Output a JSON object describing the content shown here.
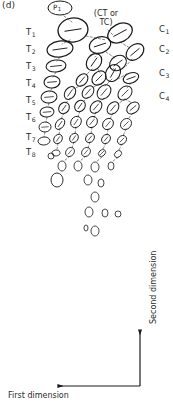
{
  "figure": {
    "panel_id": "(d)",
    "progenitor_label": "P",
    "progenitor_sub": "1",
    "annotation_line1": "(CT or",
    "annotation_line2": "TC)",
    "ink_color": "#1a1a1a",
    "dash_color": "#6b6b6b",
    "background": "#ffffff"
  },
  "time_axis": {
    "name": "T",
    "items": [
      {
        "label": "T",
        "sub": "1",
        "x": 26,
        "y": 33
      },
      {
        "label": "T",
        "sub": "2",
        "x": 26,
        "y": 50
      },
      {
        "label": "T",
        "sub": "3",
        "x": 26,
        "y": 67
      },
      {
        "label": "T",
        "sub": "4",
        "x": 26,
        "y": 84
      },
      {
        "label": "T",
        "sub": "5",
        "x": 26,
        "y": 101
      },
      {
        "label": "T",
        "sub": "6",
        "x": 26,
        "y": 118
      },
      {
        "label": "T",
        "sub": "7",
        "x": 26,
        "y": 138
      },
      {
        "label": "T",
        "sub": "8",
        "x": 26,
        "y": 153
      }
    ]
  },
  "clone_axis": {
    "name": "C",
    "items": [
      {
        "label": "C",
        "sub": "1",
        "x": 159,
        "y": 30
      },
      {
        "label": "C",
        "sub": "2",
        "x": 159,
        "y": 50
      },
      {
        "label": "C",
        "sub": "3",
        "x": 159,
        "y": 74
      },
      {
        "label": "C",
        "sub": "4",
        "x": 159,
        "y": 97
      }
    ]
  },
  "axes": {
    "x_label": "First dimension",
    "y_label": "Second dimension",
    "corner_x": 140,
    "corner_y": 386,
    "x_arrow_end": 58,
    "y_arrow_end": 330
  },
  "chart_data": {
    "type": "scatter",
    "title": "(d)",
    "xlabel": "First dimension",
    "ylabel": "Second dimension",
    "note": "Hand-drawn clonal lineage / cell-division tree; ellipses are cells, dashed segments are lineage links.",
    "cells": [
      {
        "cx": 60,
        "cy": 8,
        "rx": 12,
        "ry": 7,
        "rot": 0,
        "tick": false,
        "w": 1.0,
        "tag": "P1"
      },
      {
        "cx": 73,
        "cy": 30,
        "rx": 15,
        "ry": 12,
        "rot": -8,
        "tick": true,
        "w": 1.3
      },
      {
        "cx": 120,
        "cy": 33,
        "rx": 13,
        "ry": 9,
        "rot": -28,
        "tick": true,
        "w": 1.3
      },
      {
        "cx": 60,
        "cy": 49,
        "rx": 13,
        "ry": 8,
        "rot": -8,
        "tick": true,
        "w": 1.2
      },
      {
        "cx": 100,
        "cy": 45,
        "rx": 11,
        "ry": 8,
        "rot": -18,
        "tick": true,
        "w": 1.2
      },
      {
        "cx": 135,
        "cy": 52,
        "rx": 10,
        "ry": 7,
        "rot": -40,
        "tick": true,
        "w": 1.2
      },
      {
        "cx": 56,
        "cy": 66,
        "rx": 10,
        "ry": 6,
        "rot": -6,
        "tick": true,
        "w": 1.1
      },
      {
        "cx": 94,
        "cy": 62,
        "rx": 9,
        "ry": 7,
        "rot": -55,
        "tick": true,
        "w": 1.2
      },
      {
        "cx": 118,
        "cy": 63,
        "rx": 9,
        "ry": 7,
        "rot": -35,
        "tick": true,
        "w": 1.1
      },
      {
        "cx": 113,
        "cy": 73,
        "rx": 9,
        "ry": 7,
        "rot": -60,
        "tick": true,
        "w": 1.1
      },
      {
        "cx": 52,
        "cy": 82,
        "rx": 8,
        "ry": 6,
        "rot": -5,
        "tick": true,
        "w": 1.1
      },
      {
        "cx": 82,
        "cy": 80,
        "rx": 7,
        "ry": 5,
        "rot": -50,
        "tick": true,
        "w": 1.1
      },
      {
        "cx": 99,
        "cy": 78,
        "rx": 8,
        "ry": 6,
        "rot": -45,
        "tick": true,
        "w": 1.1
      },
      {
        "cx": 131,
        "cy": 78,
        "rx": 8,
        "ry": 5,
        "rot": -20,
        "tick": true,
        "w": 1.1
      },
      {
        "cx": 49,
        "cy": 97,
        "rx": 8,
        "ry": 6,
        "rot": -5,
        "tick": true,
        "w": 1.0
      },
      {
        "cx": 70,
        "cy": 93,
        "rx": 7,
        "ry": 5,
        "rot": -55,
        "tick": true,
        "w": 1.0
      },
      {
        "cx": 88,
        "cy": 92,
        "rx": 7,
        "ry": 5,
        "rot": -50,
        "tick": true,
        "w": 1.0
      },
      {
        "cx": 104,
        "cy": 92,
        "rx": 8,
        "ry": 6,
        "rot": -50,
        "tick": true,
        "w": 1.0
      },
      {
        "cx": 125,
        "cy": 93,
        "rx": 8,
        "ry": 6,
        "rot": -45,
        "tick": true,
        "w": 1.0
      },
      {
        "cx": 47,
        "cy": 112,
        "rx": 7,
        "ry": 5,
        "rot": -5,
        "tick": true,
        "w": 1.0
      },
      {
        "cx": 64,
        "cy": 108,
        "rx": 6,
        "ry": 5,
        "rot": -55,
        "tick": true,
        "w": 1.0
      },
      {
        "cx": 80,
        "cy": 106,
        "rx": 6,
        "ry": 5,
        "rot": -55,
        "tick": true,
        "w": 1.0
      },
      {
        "cx": 96,
        "cy": 107,
        "rx": 7,
        "ry": 5,
        "rot": -50,
        "tick": true,
        "w": 1.0
      },
      {
        "cx": 113,
        "cy": 108,
        "rx": 7,
        "ry": 5,
        "rot": -50,
        "tick": true,
        "w": 1.0
      },
      {
        "cx": 133,
        "cy": 108,
        "rx": 7,
        "ry": 5,
        "rot": -40,
        "tick": true,
        "w": 1.0
      },
      {
        "cx": 45,
        "cy": 127,
        "rx": 6,
        "ry": 5,
        "rot": -5,
        "tick": true,
        "w": 0.9
      },
      {
        "cx": 60,
        "cy": 124,
        "rx": 6,
        "ry": 4,
        "rot": -55,
        "tick": true,
        "w": 0.9
      },
      {
        "cx": 76,
        "cy": 122,
        "rx": 6,
        "ry": 5,
        "rot": -55,
        "tick": true,
        "w": 0.9
      },
      {
        "cx": 92,
        "cy": 122,
        "rx": 6,
        "ry": 5,
        "rot": -50,
        "tick": true,
        "w": 0.9
      },
      {
        "cx": 108,
        "cy": 124,
        "rx": 6,
        "ry": 5,
        "rot": -50,
        "tick": true,
        "w": 0.9
      },
      {
        "cx": 126,
        "cy": 124,
        "rx": 6,
        "ry": 5,
        "rot": -45,
        "tick": true,
        "w": 0.9
      },
      {
        "cx": 44,
        "cy": 141,
        "rx": 6,
        "ry": 4,
        "rot": -5,
        "tick": false,
        "w": 0.9
      },
      {
        "cx": 58,
        "cy": 139,
        "rx": 5,
        "ry": 4,
        "rot": -55,
        "tick": true,
        "w": 0.9
      },
      {
        "cx": 74,
        "cy": 138,
        "rx": 5,
        "ry": 4,
        "rot": -55,
        "tick": true,
        "w": 0.9
      },
      {
        "cx": 90,
        "cy": 138,
        "rx": 5,
        "ry": 4,
        "rot": -50,
        "tick": true,
        "w": 0.9
      },
      {
        "cx": 106,
        "cy": 139,
        "rx": 5,
        "ry": 4,
        "rot": -50,
        "tick": true,
        "w": 0.9
      },
      {
        "cx": 122,
        "cy": 140,
        "rx": 5,
        "ry": 4,
        "rot": -45,
        "tick": true,
        "w": 0.9
      },
      {
        "cx": 56,
        "cy": 153,
        "rx": 4,
        "ry": 3,
        "rot": -10,
        "tick": false,
        "w": 0.8
      },
      {
        "cx": 70,
        "cy": 152,
        "rx": 5,
        "ry": 4,
        "rot": -50,
        "tick": true,
        "w": 0.8
      },
      {
        "cx": 86,
        "cy": 152,
        "rx": 5,
        "ry": 4,
        "rot": -50,
        "tick": true,
        "w": 0.8
      },
      {
        "cx": 102,
        "cy": 153,
        "rx": 4,
        "ry": 3,
        "rot": -45,
        "tick": true,
        "w": 0.8
      },
      {
        "cx": 118,
        "cy": 154,
        "rx": 4,
        "ry": 3,
        "rot": -45,
        "tick": false,
        "w": 0.8
      },
      {
        "cx": 62,
        "cy": 166,
        "rx": 4,
        "ry": 5,
        "rot": 0,
        "tick": false,
        "w": 0.8
      },
      {
        "cx": 78,
        "cy": 166,
        "rx": 4,
        "ry": 5,
        "rot": 0,
        "tick": false,
        "w": 0.8
      },
      {
        "cx": 95,
        "cy": 167,
        "rx": 4,
        "ry": 5,
        "rot": 0,
        "tick": false,
        "w": 0.8
      },
      {
        "cx": 111,
        "cy": 166,
        "rx": 3,
        "ry": 4,
        "rot": 0,
        "tick": false,
        "w": 0.8
      },
      {
        "cx": 51,
        "cy": 156,
        "rx": 3,
        "ry": 3,
        "rot": 0,
        "tick": false,
        "w": 0.8
      },
      {
        "cx": 57,
        "cy": 180,
        "rx": 6,
        "ry": 7,
        "rot": 0,
        "tick": false,
        "w": 0.9
      },
      {
        "cx": 88,
        "cy": 180,
        "rx": 4,
        "ry": 5,
        "rot": 0,
        "tick": false,
        "w": 0.8
      },
      {
        "cx": 101,
        "cy": 183,
        "rx": 3,
        "ry": 4,
        "rot": 0,
        "tick": false,
        "w": 0.8
      },
      {
        "cx": 95,
        "cy": 197,
        "rx": 4,
        "ry": 5,
        "rot": 0,
        "tick": false,
        "w": 0.8
      },
      {
        "cx": 89,
        "cy": 212,
        "rx": 4,
        "ry": 5,
        "rot": 0,
        "tick": false,
        "w": 0.8
      },
      {
        "cx": 105,
        "cy": 213,
        "rx": 3,
        "ry": 4,
        "rot": 0,
        "tick": false,
        "w": 0.8
      },
      {
        "cx": 118,
        "cy": 214,
        "rx": 3,
        "ry": 3,
        "rot": 0,
        "tick": false,
        "w": 0.8
      },
      {
        "cx": 86,
        "cy": 228,
        "rx": 2,
        "ry": 3,
        "rot": 0,
        "tick": false,
        "w": 0.8
      },
      {
        "cx": 95,
        "cy": 231,
        "rx": 4,
        "ry": 5,
        "rot": 0,
        "tick": false,
        "w": 0.8
      }
    ],
    "links": [
      {
        "x1": 64,
        "y1": 16,
        "x2": 72,
        "y2": 22
      },
      {
        "x1": 86,
        "y1": 36,
        "x2": 106,
        "y2": 40
      },
      {
        "x1": 108,
        "y1": 30,
        "x2": 113,
        "y2": 35
      },
      {
        "x1": 70,
        "y1": 40,
        "x2": 62,
        "y2": 44
      },
      {
        "x1": 120,
        "y1": 42,
        "x2": 130,
        "y2": 48
      },
      {
        "x1": 98,
        "y1": 53,
        "x2": 95,
        "y2": 57
      },
      {
        "x1": 60,
        "y1": 57,
        "x2": 57,
        "y2": 61
      },
      {
        "x1": 106,
        "y1": 52,
        "x2": 115,
        "y2": 58
      },
      {
        "x1": 132,
        "y1": 59,
        "x2": 126,
        "y2": 66
      },
      {
        "x1": 92,
        "y1": 69,
        "x2": 86,
        "y2": 75
      },
      {
        "x1": 98,
        "y1": 69,
        "x2": 100,
        "y2": 73
      },
      {
        "x1": 115,
        "y1": 70,
        "x2": 113,
        "y2": 68
      },
      {
        "x1": 56,
        "y1": 72,
        "x2": 53,
        "y2": 77
      },
      {
        "x1": 112,
        "y1": 79,
        "x2": 105,
        "y2": 86
      },
      {
        "x1": 118,
        "y1": 79,
        "x2": 128,
        "y2": 73
      },
      {
        "x1": 131,
        "y1": 83,
        "x2": 127,
        "y2": 88
      },
      {
        "x1": 82,
        "y1": 85,
        "x2": 73,
        "y2": 89
      },
      {
        "x1": 99,
        "y1": 84,
        "x2": 92,
        "y2": 88
      },
      {
        "x1": 52,
        "y1": 88,
        "x2": 50,
        "y2": 92
      },
      {
        "x1": 70,
        "y1": 98,
        "x2": 66,
        "y2": 103
      },
      {
        "x1": 88,
        "y1": 97,
        "x2": 83,
        "y2": 102
      },
      {
        "x1": 104,
        "y1": 98,
        "x2": 99,
        "y2": 103
      },
      {
        "x1": 125,
        "y1": 99,
        "x2": 118,
        "y2": 104
      },
      {
        "x1": 125,
        "y1": 99,
        "x2": 132,
        "y2": 103
      },
      {
        "x1": 49,
        "y1": 103,
        "x2": 48,
        "y2": 107
      },
      {
        "x1": 64,
        "y1": 113,
        "x2": 61,
        "y2": 119
      },
      {
        "x1": 80,
        "y1": 111,
        "x2": 78,
        "y2": 117
      },
      {
        "x1": 96,
        "y1": 112,
        "x2": 94,
        "y2": 118
      },
      {
        "x1": 113,
        "y1": 113,
        "x2": 110,
        "y2": 119
      },
      {
        "x1": 133,
        "y1": 113,
        "x2": 128,
        "y2": 119
      },
      {
        "x1": 47,
        "y1": 117,
        "x2": 46,
        "y2": 122
      },
      {
        "x1": 60,
        "y1": 128,
        "x2": 59,
        "y2": 135
      },
      {
        "x1": 76,
        "y1": 127,
        "x2": 75,
        "y2": 134
      },
      {
        "x1": 92,
        "y1": 127,
        "x2": 91,
        "y2": 134
      },
      {
        "x1": 108,
        "y1": 129,
        "x2": 107,
        "y2": 135
      },
      {
        "x1": 126,
        "y1": 129,
        "x2": 123,
        "y2": 136
      },
      {
        "x1": 45,
        "y1": 132,
        "x2": 44,
        "y2": 137
      },
      {
        "x1": 58,
        "y1": 143,
        "x2": 57,
        "y2": 149
      },
      {
        "x1": 74,
        "y1": 142,
        "x2": 72,
        "y2": 148
      },
      {
        "x1": 90,
        "y1": 142,
        "x2": 88,
        "y2": 148
      },
      {
        "x1": 106,
        "y1": 143,
        "x2": 103,
        "y2": 149
      },
      {
        "x1": 122,
        "y1": 144,
        "x2": 119,
        "y2": 150
      },
      {
        "x1": 70,
        "y1": 156,
        "x2": 64,
        "y2": 161
      },
      {
        "x1": 86,
        "y1": 156,
        "x2": 80,
        "y2": 161
      },
      {
        "x1": 102,
        "y1": 157,
        "x2": 96,
        "y2": 162
      },
      {
        "x1": 118,
        "y1": 157,
        "x2": 112,
        "y2": 162
      }
    ]
  }
}
